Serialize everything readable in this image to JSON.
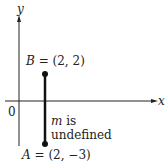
{
  "diagram": {
    "axes": {
      "x_label": "x",
      "y_label": "y",
      "origin_label": "0"
    },
    "points": [
      {
        "name": "B",
        "coords": "(2, 2)",
        "x": 2,
        "y": 2
      },
      {
        "name": "A",
        "coords": "(2, −3)",
        "x": 2,
        "y": -3
      }
    ],
    "annotation": {
      "slope_symbol": "m",
      "text_line1": "is",
      "text_line2": "undefined"
    },
    "equals": "="
  }
}
